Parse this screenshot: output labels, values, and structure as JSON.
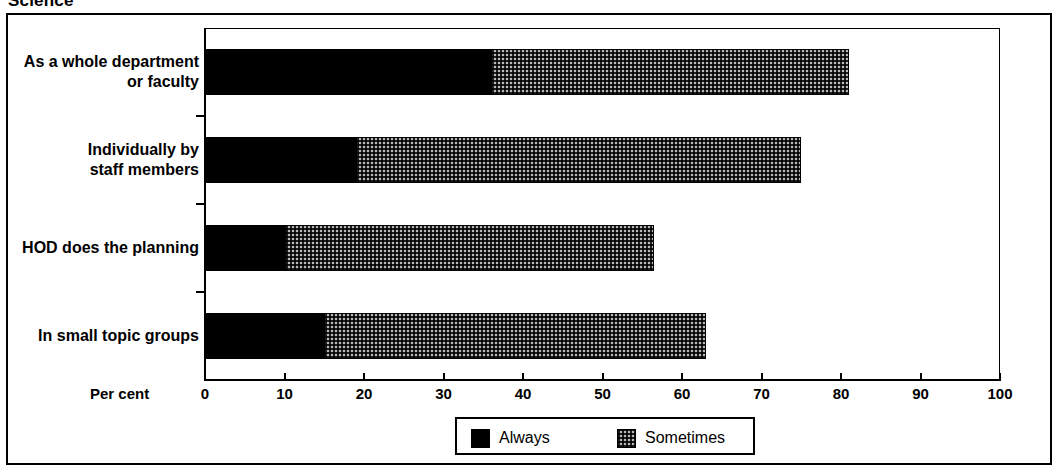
{
  "figure": {
    "title": "Science",
    "percent_caption": "Per cent"
  },
  "legend": {
    "position": "bottom-center",
    "items": [
      {
        "label": "Always",
        "color": "#000000",
        "pattern": "solid"
      },
      {
        "label": "Sometimes",
        "color": "#b9b9b9",
        "pattern": "checkered"
      }
    ]
  },
  "chart_data": {
    "type": "bar",
    "orientation": "horizontal",
    "stacked": true,
    "title": "Science",
    "xlabel": "Per cent",
    "ylabel": "",
    "xlim": [
      0,
      100
    ],
    "xticks": [
      0,
      10,
      20,
      30,
      40,
      50,
      60,
      70,
      80,
      90,
      100
    ],
    "grid": false,
    "categories": [
      "As a whole department\nor faculty",
      "Individually by\nstaff members",
      "HOD does the planning",
      "In small topic groups"
    ],
    "series": [
      {
        "name": "Always",
        "values": [
          36,
          19,
          10,
          15
        ]
      },
      {
        "name": "Sometimes",
        "values": [
          45,
          56,
          46.5,
          48
        ]
      }
    ],
    "totals": [
      81,
      75,
      56.5,
      63
    ]
  }
}
